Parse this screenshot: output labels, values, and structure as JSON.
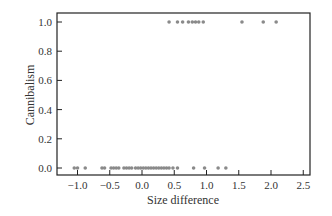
{
  "chart_data": {
    "type": "scatter",
    "title": "",
    "xlabel": "Size difference",
    "ylabel": "Cannibalism",
    "xlim": [
      -1.25,
      2.65
    ],
    "ylim": [
      -0.05,
      1.05
    ],
    "xticks": [
      -1.0,
      -0.5,
      0.0,
      0.5,
      1.0,
      1.5,
      2.0,
      2.5
    ],
    "xtick_labels": [
      "−1.0",
      "−0.5",
      "0.0",
      "0.5",
      "1.0",
      "1.5",
      "2.0",
      "2.5"
    ],
    "yticks": [
      0.0,
      0.2,
      0.4,
      0.6,
      0.8,
      1.0
    ],
    "ytick_labels": [
      "0.0",
      "0.2",
      "0.4",
      "0.6",
      "0.8",
      "1.0"
    ],
    "grid": false,
    "legend": null,
    "series": [
      {
        "name": "Cannibalism = 1",
        "x": [
          0.42,
          0.55,
          0.63,
          0.72,
          0.78,
          0.83,
          0.88,
          0.95,
          1.55,
          1.88,
          2.08
        ],
        "y": [
          1,
          1,
          1,
          1,
          1,
          1,
          1,
          1,
          1,
          1,
          1
        ]
      },
      {
        "name": "Cannibalism = 0",
        "x": [
          -1.05,
          -1.0,
          -0.88,
          -0.62,
          -0.58,
          -0.48,
          -0.44,
          -0.4,
          -0.36,
          -0.28,
          -0.24,
          -0.2,
          -0.16,
          -0.1,
          -0.06,
          -0.02,
          0.02,
          0.06,
          0.1,
          0.14,
          0.18,
          0.22,
          0.26,
          0.3,
          0.34,
          0.38,
          0.42,
          0.48,
          0.55,
          0.8,
          0.97,
          1.18,
          1.3
        ],
        "y": [
          0,
          0,
          0,
          0,
          0,
          0,
          0,
          0,
          0,
          0,
          0,
          0,
          0,
          0,
          0,
          0,
          0,
          0,
          0,
          0,
          0,
          0,
          0,
          0,
          0,
          0,
          0,
          0,
          0,
          0,
          0,
          0,
          0
        ]
      }
    ],
    "point_color": "#8a8a8a"
  }
}
